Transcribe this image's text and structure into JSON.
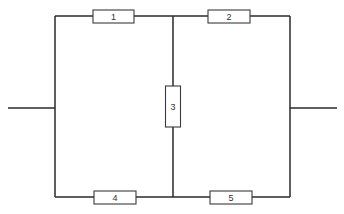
{
  "diagram": {
    "type": "resistor-bridge-circuit",
    "colors": {
      "background": "#ffffff",
      "wire": "#2a2a2a",
      "resistor_border": "#3a3a3a",
      "label": "#333333"
    },
    "resistors": [
      {
        "id": "1",
        "label": "1",
        "position": "top-left",
        "orientation": "horizontal"
      },
      {
        "id": "2",
        "label": "2",
        "position": "top-right",
        "orientation": "horizontal"
      },
      {
        "id": "3",
        "label": "3",
        "position": "center",
        "orientation": "vertical"
      },
      {
        "id": "4",
        "label": "4",
        "position": "bottom-left",
        "orientation": "horizontal"
      },
      {
        "id": "5",
        "label": "5",
        "position": "bottom-right",
        "orientation": "horizontal"
      }
    ],
    "terminals": [
      {
        "id": "left",
        "position": "left-middle"
      },
      {
        "id": "right",
        "position": "right-middle"
      }
    ]
  }
}
